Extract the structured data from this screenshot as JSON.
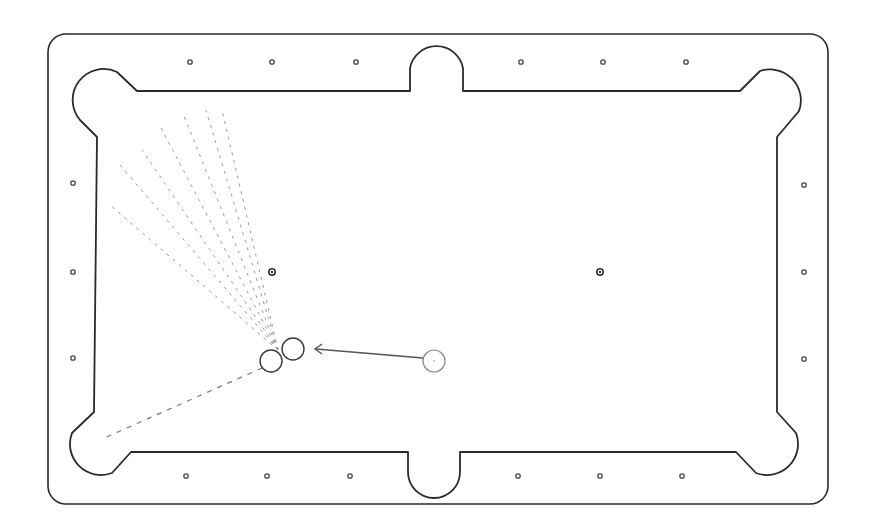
{
  "diagram": {
    "table_type": "6-pocket pool table",
    "colors": {
      "outline": "#2a2a2a",
      "background": "#ffffff",
      "fan_lines": "#9a9a9a",
      "cue_path": "#555555"
    },
    "pockets": [
      {
        "name": "top-left-corner-pocket"
      },
      {
        "name": "top-side-pocket"
      },
      {
        "name": "top-right-corner-pocket"
      },
      {
        "name": "bottom-left-corner-pocket"
      },
      {
        "name": "bottom-side-pocket"
      },
      {
        "name": "bottom-right-corner-pocket"
      }
    ],
    "diamonds": {
      "top_count": 6,
      "bottom_count": 6,
      "left_count": 3,
      "right_count": 3
    },
    "spots": [
      {
        "name": "head-spot"
      },
      {
        "name": "foot-spot"
      }
    ],
    "balls": [
      {
        "name": "object-ball-1",
        "role": "object ball"
      },
      {
        "name": "object-ball-2",
        "role": "object ball"
      },
      {
        "name": "cue-ball",
        "role": "cue ball"
      }
    ],
    "annotations": {
      "cue_direction": "cue ball aimed left toward object ball pair",
      "fan_line_count": 7,
      "fan_description": "range of possible object ball paths toward top-left corner pocket",
      "bottom_path_description": "object ball path toward bottom-left corner pocket"
    }
  }
}
